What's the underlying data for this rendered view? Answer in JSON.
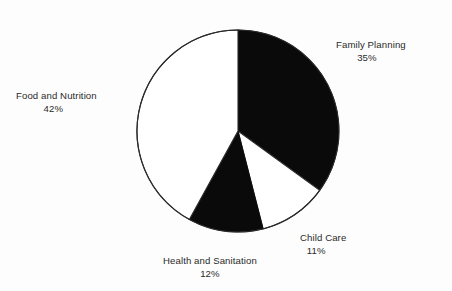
{
  "chart_data": {
    "type": "pie",
    "title": "",
    "subtitle": "",
    "xlabel": "",
    "ylabel": "",
    "grid": false,
    "legend_position": "none",
    "labels_position": "outside",
    "start_angle_deg": 0,
    "direction": "clockwise",
    "categories": [
      "Family Planning",
      "Child Care",
      "Health and Sanitation",
      "Food and Nutrition"
    ],
    "values": [
      35,
      11,
      12,
      42
    ],
    "unit": "%",
    "slices": [
      {
        "name": "Family Planning",
        "value": 35,
        "value_label": "35%",
        "fill": "#0a0a0a",
        "fill_name": "black",
        "start_angle_deg": 0,
        "end_angle_deg": 126
      },
      {
        "name": "Child Care",
        "value": 11,
        "value_label": "11%",
        "fill": "#ffffff",
        "fill_name": "white",
        "start_angle_deg": 126,
        "end_angle_deg": 165.6
      },
      {
        "name": "Health and Sanitation",
        "value": 12,
        "value_label": "12%",
        "fill": "#0a0a0a",
        "fill_name": "black",
        "start_angle_deg": 165.6,
        "end_angle_deg": 208.8
      },
      {
        "name": "Food and Nutrition",
        "value": 42,
        "value_label": "42%",
        "fill": "#ffffff",
        "fill_name": "white",
        "start_angle_deg": 208.8,
        "end_angle_deg": 360
      }
    ]
  },
  "labels": {
    "family_planning": {
      "name": "Family Planning",
      "value": "35%"
    },
    "child_care": {
      "name": "Child Care",
      "value": "11%"
    },
    "health_sanitation": {
      "name": "Health and Sanitation",
      "value": "12%"
    },
    "food_nutrition": {
      "name": "Food and Nutrition",
      "value": "42%"
    }
  },
  "style": {
    "background": "#fdfdfd",
    "text_color": "#2a2a2a",
    "outline_color": "#2b2b2b",
    "slice_dark": "#0a0a0a",
    "slice_light": "#ffffff"
  }
}
